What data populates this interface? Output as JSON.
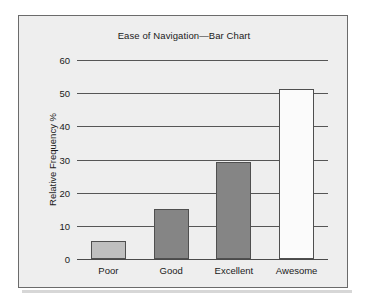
{
  "figure": {
    "title": "Ease of Navigation—Bar Chart",
    "frame_color": "#6b6b6b",
    "background_color": "#eeeeee"
  },
  "chart_data": {
    "type": "bar",
    "title": "Ease of Navigation—Bar Chart",
    "xlabel": "",
    "ylabel": "Relative Frequency %",
    "categories": [
      "Poor",
      "Good",
      "Excellent",
      "Awesome"
    ],
    "values": [
      5.4,
      15.2,
      29.3,
      51.3
    ],
    "bar_colors": [
      "#bfbfbf",
      "#858585",
      "#858585",
      "#fbfbfb"
    ],
    "bar_edge_color": "#4f4f4f",
    "ylim": [
      0,
      60
    ],
    "yticks": [
      0,
      10,
      20,
      30,
      40,
      50,
      60
    ],
    "ytick_labels": [
      "0",
      "10",
      "20",
      "30",
      "40",
      "50",
      "60"
    ],
    "grid": true,
    "grid_axis": "y",
    "legend": false,
    "legend_position": "none"
  }
}
